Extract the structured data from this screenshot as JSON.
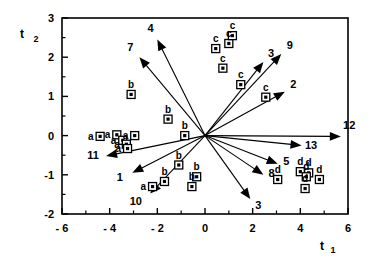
{
  "chart_data": {
    "type": "scatter",
    "title": "",
    "subtitle": "",
    "xlabel": "t 1",
    "ylabel": "t 2",
    "xlabel_main": "t",
    "xlabel_sub": "1",
    "ylabel_main": "t",
    "ylabel_sub": "2",
    "xlim": [
      -6,
      6
    ],
    "ylim": [
      -2,
      3
    ],
    "xticks": [
      -6,
      -4,
      -2,
      0,
      2,
      4,
      6
    ],
    "xticklabels": [
      "- 6",
      "- 4",
      "- 2",
      "0",
      "2",
      "4",
      "6"
    ],
    "yticks": [
      -2,
      -1,
      0,
      1,
      2,
      3
    ],
    "yticklabels": [
      "-2",
      "-1",
      "0",
      "1",
      "2",
      "3"
    ],
    "x_minor_ticks": [
      -5,
      -3,
      -1,
      1,
      3,
      5
    ],
    "y_minor_ticks": [
      -1.5,
      -0.5,
      0.5,
      1.5,
      2.5
    ],
    "grid": false,
    "legend": "none",
    "frame": "box",
    "series": [
      {
        "name": "a",
        "label": "a",
        "label_side": "left",
        "points": [
          {
            "x": -4.4,
            "y": -0.02
          },
          {
            "x": -3.7,
            "y": 0.02
          },
          {
            "x": -3.45,
            "y": -0.12
          },
          {
            "x": -3.3,
            "y": -0.22
          },
          {
            "x": -2.95,
            "y": 0.0
          },
          {
            "x": -3.25,
            "y": -0.33
          },
          {
            "x": -2.2,
            "y": -1.3
          }
        ]
      },
      {
        "name": "b",
        "label": "b",
        "label_side": "top",
        "points": [
          {
            "x": -3.1,
            "y": 1.05
          },
          {
            "x": -1.55,
            "y": 0.42
          },
          {
            "x": -0.85,
            "y": 0.0
          },
          {
            "x": -1.1,
            "y": -0.75
          },
          {
            "x": -0.35,
            "y": -1.05
          },
          {
            "x": -1.7,
            "y": -1.17
          },
          {
            "x": -0.55,
            "y": -1.3
          }
        ]
      },
      {
        "name": "c",
        "label": "c",
        "label_side": "top",
        "points": [
          {
            "x": 0.45,
            "y": 2.22
          },
          {
            "x": 1.0,
            "y": 2.35
          },
          {
            "x": 1.15,
            "y": 2.55
          },
          {
            "x": 0.75,
            "y": 1.72
          },
          {
            "x": 1.5,
            "y": 1.3
          },
          {
            "x": 2.55,
            "y": 0.98
          }
        ]
      },
      {
        "name": "d",
        "label": "d",
        "label_side": "top",
        "points": [
          {
            "x": 3.05,
            "y": -1.12
          },
          {
            "x": 4.0,
            "y": -0.92
          },
          {
            "x": 4.35,
            "y": -0.95
          },
          {
            "x": 4.25,
            "y": -1.05
          },
          {
            "x": 4.8,
            "y": -1.12
          },
          {
            "x": 4.2,
            "y": -1.35
          }
        ]
      }
    ],
    "vectors": [
      {
        "label": "4",
        "x": -2.0,
        "y": 2.45,
        "label_dx": -0.28,
        "label_dy": 0.3
      },
      {
        "label": "7",
        "x": -2.75,
        "y": 2.0,
        "label_dx": -0.38,
        "label_dy": 0.26
      },
      {
        "label": "11",
        "x": -4.15,
        "y": -0.52,
        "label_dx": -0.55,
        "label_dy": 0.02
      },
      {
        "label": "1",
        "x": -3.05,
        "y": -0.95,
        "label_dx": -0.52,
        "label_dy": -0.1
      },
      {
        "label": "10",
        "x": -2.3,
        "y": -1.48,
        "label_dx": -0.6,
        "label_dy": -0.18
      },
      {
        "label": "3",
        "x": 2.45,
        "y": 1.88,
        "label_dx": 0.32,
        "label_dy": 0.22
      },
      {
        "label": "9",
        "x": 3.2,
        "y": 2.08,
        "label_dx": 0.36,
        "label_dy": 0.22
      },
      {
        "label": "2",
        "x": 3.35,
        "y": 1.12,
        "label_dx": 0.36,
        "label_dy": 0.2
      },
      {
        "label": "12",
        "x": 5.7,
        "y": -0.02,
        "label_dx": 0.35,
        "label_dy": 0.3
      },
      {
        "label": "13",
        "x": 4.05,
        "y": -0.25,
        "label_dx": 0.4,
        "label_dy": 0.02
      },
      {
        "label": "5",
        "x": 3.05,
        "y": -0.72,
        "label_dx": 0.36,
        "label_dy": 0.06
      },
      {
        "label": "8",
        "x": 2.45,
        "y": -1.0,
        "label_dx": 0.34,
        "label_dy": 0.04
      },
      {
        "label": "3",
        "x": 1.9,
        "y": -1.62,
        "label_dx": 0.34,
        "label_dy": -0.16
      }
    ]
  }
}
